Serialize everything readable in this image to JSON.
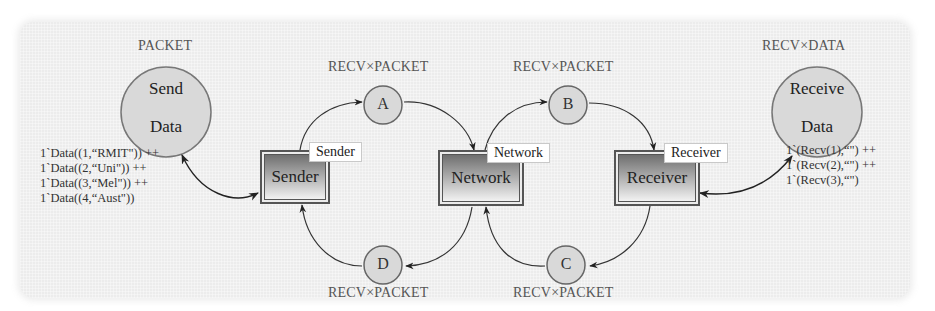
{
  "diagram": {
    "type": "coloured-petri-net",
    "places": {
      "send_data": {
        "line1": "Send",
        "line2": "Data",
        "colour_set": "PACKET"
      },
      "receive_data": {
        "line1": "Receive",
        "line2": "Data",
        "colour_set": "RECV×DATA"
      },
      "a": {
        "label": "A",
        "colour_set": "RECV×PACKET"
      },
      "b": {
        "label": "B",
        "colour_set": "RECV×PACKET"
      },
      "c": {
        "label": "C",
        "colour_set": "RECV×PACKET"
      },
      "d": {
        "label": "D",
        "colour_set": "RECV×PACKET"
      }
    },
    "initial_markings": {
      "send_data": [
        "1`Data((1,“RMIT\")) ++",
        "1`Data((2,“Uni\")) ++",
        "1`Data((3,“Mel\")) ++",
        "1`Data((4,“Aust\"))"
      ],
      "receive_data": [
        "1`(Recv(1),“\") ++",
        "1`(Recv(2),“\") ++",
        "1`(Recv(3),“\")"
      ]
    },
    "transitions": {
      "sender": {
        "label": "Sender",
        "subpage_tag": "Sender"
      },
      "network": {
        "label": "Network",
        "subpage_tag": "Network"
      },
      "receiver": {
        "label": "Receiver",
        "subpage_tag": "Receiver"
      }
    },
    "arcs": [
      {
        "from": "Send Data",
        "to": "Sender",
        "bidirectional": true
      },
      {
        "from": "Sender",
        "to": "A"
      },
      {
        "from": "A",
        "to": "Network"
      },
      {
        "from": "Network",
        "to": "B"
      },
      {
        "from": "B",
        "to": "Receiver"
      },
      {
        "from": "Receiver",
        "to": "Receive Data",
        "bidirectional": true
      },
      {
        "from": "Receiver",
        "to": "C"
      },
      {
        "from": "C",
        "to": "Network"
      },
      {
        "from": "Network",
        "to": "D"
      },
      {
        "from": "D",
        "to": "Sender"
      }
    ]
  },
  "colors": {
    "panel": "#ececec",
    "place_fill": "#d9d9d9",
    "place_stroke": "#777777",
    "arc": "#333333",
    "label_text": "#555555"
  }
}
